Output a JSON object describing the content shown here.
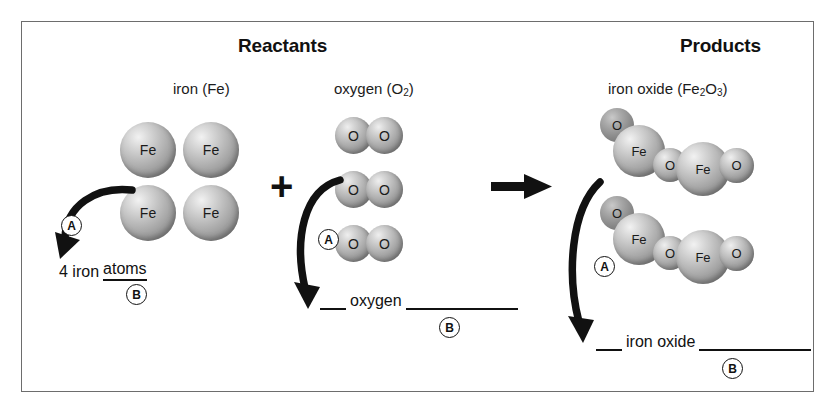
{
  "diagram": {
    "title_reactants": "Reactants",
    "title_products": "Products",
    "operator_plus": "+",
    "operator_yields": "yields-arrow"
  },
  "reactants": {
    "iron": {
      "caption_prefix": "iron (",
      "caption_symbol": "Fe",
      "caption_suffix": ")",
      "atom_label": "Fe",
      "atom_count": 4,
      "atoms": [
        {
          "label": "Fe",
          "x": 120,
          "y": 122,
          "d": 56
        },
        {
          "label": "Fe",
          "x": 183,
          "y": 122,
          "d": 56
        },
        {
          "label": "Fe",
          "x": 120,
          "y": 185,
          "d": 56
        },
        {
          "label": "Fe",
          "x": 183,
          "y": 185,
          "d": 56
        }
      ],
      "answer_text_1": "4 iron",
      "answer_underlined": "atoms",
      "marker_a": "A",
      "marker_b": "B"
    },
    "oxygen": {
      "caption_prefix": "oxygen (O",
      "caption_sub": "2",
      "caption_suffix": ")",
      "atom_label": "O",
      "molecule_count": 3,
      "molecules": [
        {
          "x": 335,
          "y": 117
        },
        {
          "x": 335,
          "y": 171
        },
        {
          "x": 335,
          "y": 225
        }
      ],
      "answer_text": "oxygen",
      "marker_a": "A",
      "marker_b": "B"
    }
  },
  "products": {
    "iron_oxide": {
      "caption_prefix": "iron oxide (Fe",
      "caption_sub1": "2",
      "caption_mid": "O",
      "caption_sub2": "3",
      "caption_suffix": ")",
      "fe_label": "Fe",
      "o_label": "O",
      "molecule_count": 2,
      "answer_text": "iron oxide",
      "marker_a": "A",
      "marker_b": "B"
    }
  },
  "colors": {
    "frame_border": "#6d6d6d",
    "ink": "#111111",
    "sphere_light": "#f2f2f2",
    "sphere_dark": "#6b6b6b",
    "background": "#ffffff"
  }
}
